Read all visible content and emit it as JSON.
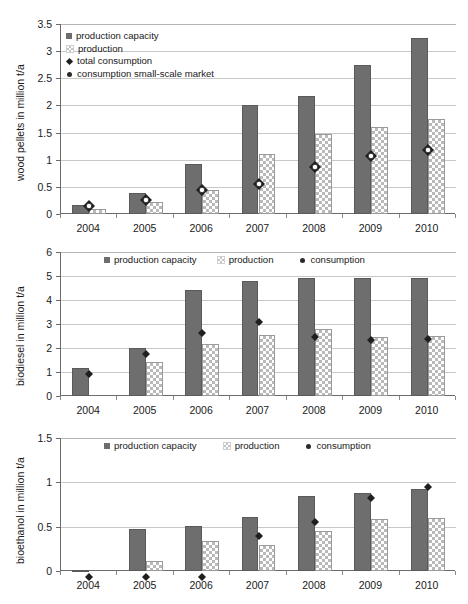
{
  "chart_data": [
    {
      "type": "bar",
      "title": "",
      "xlabel": "",
      "ylabel": "wood pellets in million t/a",
      "categories": [
        "2004",
        "2005",
        "2006",
        "2007",
        "2008",
        "2009",
        "2010"
      ],
      "ylim": [
        0,
        3.5
      ],
      "yticks": [
        "0",
        "0.5",
        "1",
        "1.5",
        "2",
        "2.5",
        "3",
        "3.5"
      ],
      "grid": true,
      "legend_position": "upper-left-inside",
      "series": [
        {
          "name": "production capacity",
          "marker": "square-dark",
          "values": [
            0.17,
            0.38,
            0.92,
            2.0,
            2.17,
            2.75,
            3.25
          ]
        },
        {
          "name": "production",
          "marker": "checker-light",
          "values": [
            0.1,
            0.22,
            0.45,
            1.1,
            1.48,
            1.6,
            1.75
          ]
        },
        {
          "name": "total consumption",
          "marker": "diamond",
          "values": [
            0.18,
            0.3,
            0.47,
            0.59,
            0.9,
            1.1,
            1.21
          ]
        },
        {
          "name": "consumption small-scale market",
          "marker": "circle",
          "values": [
            0.18,
            0.3,
            0.47,
            0.59,
            0.9,
            1.1,
            1.21
          ]
        }
      ]
    },
    {
      "type": "bar",
      "title": "",
      "xlabel": "",
      "ylabel": "biodiesel in million t/a",
      "categories": [
        "2004",
        "2005",
        "2006",
        "2007",
        "2008",
        "2009",
        "2010"
      ],
      "ylim": [
        0,
        6
      ],
      "yticks": [
        "0",
        "1",
        "2",
        "3",
        "4",
        "5",
        "6"
      ],
      "grid": true,
      "legend_position": "top-inside",
      "series": [
        {
          "name": "production capacity",
          "marker": "square-dark",
          "values": [
            1.16,
            2.0,
            4.4,
            4.8,
            4.9,
            4.9,
            4.9
          ]
        },
        {
          "name": "production",
          "marker": "checker-light",
          "values": [
            0,
            1.43,
            2.18,
            2.56,
            2.8,
            2.45,
            2.5
          ]
        },
        {
          "name": "consumption",
          "marker": "diamond",
          "values": [
            1.18,
            1.99,
            2.89,
            3.34,
            2.72,
            2.57,
            2.61
          ]
        }
      ]
    },
    {
      "type": "bar",
      "title": "",
      "xlabel": "",
      "ylabel": "bioethanol in million t/a",
      "categories": [
        "2004",
        "2005",
        "2006",
        "2007",
        "2008",
        "2009",
        "2010"
      ],
      "ylim": [
        0,
        1.5
      ],
      "yticks": [
        "0",
        "0.5",
        "1",
        "1.5"
      ],
      "grid": true,
      "legend_position": "top-inside",
      "series": [
        {
          "name": "production capacity",
          "marker": "square-dark",
          "values": [
            0.01,
            0.475,
            0.505,
            0.605,
            0.845,
            0.875,
            0.93
          ]
        },
        {
          "name": "production",
          "marker": "checker-light",
          "values": [
            0.0,
            0.11,
            0.335,
            0.295,
            0.45,
            0.585,
            0.595
          ]
        },
        {
          "name": "consumption",
          "marker": "diamond",
          "values": [
            0.0,
            0.0,
            0.0,
            0.465,
            0.625,
            0.895,
            1.015
          ]
        }
      ]
    }
  ],
  "colors": {
    "capacity_fill": "#6e6e6e",
    "production_fill": "#b9b9b9",
    "marker": "#1f1f1f",
    "axis": "#6b6b6b",
    "grid": "#c8c8c8"
  },
  "panels": [
    {
      "id": "wood-pellets",
      "ylabel": "wood pellets in million t/a",
      "yticks": [
        "3.5",
        "3",
        "2.5",
        "2",
        "1.5",
        "1",
        "0.5",
        "0"
      ],
      "xticks": [
        "2004",
        "2005",
        "2006",
        "2007",
        "2008",
        "2009",
        "2010"
      ],
      "legend": [
        "production capacity",
        "production",
        "total consumption",
        "consumption small-scale market"
      ]
    },
    {
      "id": "biodiesel",
      "ylabel": "biodiesel in million t/a",
      "yticks": [
        "6",
        "5",
        "4",
        "3",
        "2",
        "1",
        "0"
      ],
      "xticks": [
        "2004",
        "2005",
        "2006",
        "2007",
        "2008",
        "2009",
        "2010"
      ],
      "legend": [
        "production capacity",
        "production",
        "consumption"
      ]
    },
    {
      "id": "bioethanol",
      "ylabel": "bioethanol in million t/a",
      "yticks": [
        "1.5",
        "1",
        "0.5",
        "0"
      ],
      "xticks": [
        "2004",
        "2005",
        "2006",
        "2007",
        "2008",
        "2009",
        "2010"
      ],
      "legend": [
        "production capacity",
        "production",
        "consumption"
      ]
    }
  ]
}
